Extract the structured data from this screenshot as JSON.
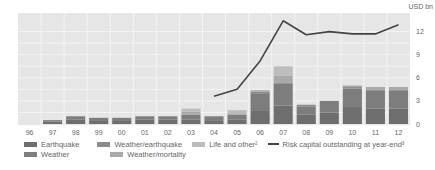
{
  "chart_data": {
    "type": "bar",
    "title": "",
    "unit_label": "USD bn",
    "xlabel": "",
    "ylabel": "USD bn",
    "ylim": [
      0,
      13.5
    ],
    "yticks": [
      0,
      3,
      6,
      9,
      12
    ],
    "grid": true,
    "categories": [
      "96",
      "97",
      "98",
      "99",
      "00",
      "01",
      "02",
      "03",
      "04",
      "05",
      "06",
      "07",
      "08",
      "09",
      "10",
      "11",
      "12"
    ],
    "series": [
      {
        "name": "Earthquake",
        "kind": "bar",
        "color": "#6e6e6e",
        "values": [
          0,
          0.3,
          0.6,
          0.5,
          0.5,
          0.6,
          0.6,
          0.6,
          0.5,
          0.6,
          1.8,
          2.4,
          1.2,
          1.5,
          2.2,
          2.0,
          2.0
        ]
      },
      {
        "name": "Weather",
        "kind": "bar",
        "color": "#7d7d7d",
        "values": [
          0,
          0.2,
          0.4,
          0.3,
          0.3,
          0.4,
          0.4,
          0.6,
          0.5,
          0.6,
          2.2,
          2.9,
          1.1,
          1.5,
          2.4,
          2.3,
          2.3
        ]
      },
      {
        "name": "Weather/earthquake",
        "kind": "bar",
        "color": "#8c8c8c",
        "values": [
          0,
          0,
          0,
          0,
          0,
          0,
          0,
          0,
          0,
          0,
          0.2,
          0,
          0.2,
          0,
          0.2,
          0.2,
          0.2
        ]
      },
      {
        "name": "Weather/mortality",
        "kind": "bar",
        "color": "#a9a9a9",
        "values": [
          0,
          0,
          0,
          0,
          0,
          0,
          0,
          0.4,
          0,
          0.2,
          0.2,
          1.0,
          0,
          0,
          0.2,
          0.3,
          0.3
        ]
      },
      {
        "name": "Life and other²",
        "kind": "bar",
        "color": "#bdbdbd",
        "values": [
          0,
          0,
          0,
          0,
          0,
          0,
          0,
          0.4,
          0,
          0.4,
          0,
          1.2,
          0,
          0,
          0,
          0,
          0
        ]
      },
      {
        "name": "Risk capital outstanding at year-end³",
        "kind": "line",
        "color": "#444444",
        "values": [
          null,
          null,
          null,
          null,
          null,
          null,
          null,
          null,
          3.6,
          4.5,
          8.2,
          13.4,
          11.6,
          12.0,
          11.7,
          11.7,
          12.9
        ]
      }
    ],
    "legend_position": "bottom"
  },
  "legend": {
    "row1": [
      "Earthquake",
      "Weather/earthquake",
      "Life and other²",
      "Risk capital outstanding at year-end³"
    ],
    "row2": [
      "Weather",
      "Weather/mortality"
    ]
  }
}
